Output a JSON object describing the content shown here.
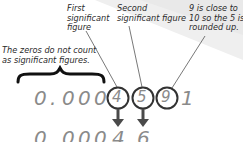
{
  "labels": {
    "first": [
      "First",
      "significant",
      "figure"
    ],
    "second": [
      "Second",
      "significant figure"
    ],
    "third": [
      "9 is close to",
      "10 so the 5 is",
      "rounded up."
    ],
    "zeros": [
      "The zeros do not count",
      "as significant figures."
    ]
  },
  "original_number": {
    "leading": [
      "0",
      ".",
      "0",
      "0",
      "0"
    ],
    "circled": [
      "4",
      "5",
      "9"
    ],
    "trailing": "1"
  },
  "rounded_number": {
    "chars": [
      "0",
      ".",
      "0",
      "0",
      "0",
      "4",
      "6"
    ]
  },
  "colors": {
    "text": "#2a2a2a",
    "digits": "#8a8a8a",
    "circle": "#333333",
    "arrow": "#4a4a4a",
    "band": "#ededed"
  }
}
